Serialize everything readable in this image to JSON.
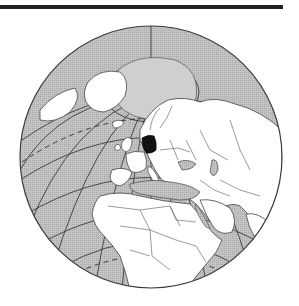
{
  "map": {
    "title": "Germany location on globe",
    "projection": "orthographic",
    "highlighted_country": "Germany",
    "center_region": "Europe",
    "visible_regions": [
      "Arctic Ocean",
      "Greenland",
      "Europe",
      "North Africa",
      "Middle East",
      "Sub-Saharan Africa",
      "Atlantic Ocean",
      "Indian Ocean"
    ],
    "colors": {
      "ocean": "#b9b9b9",
      "land": "#ffffff",
      "border": "#444444",
      "highlight": "#111111",
      "graticule": "#3a3a3a",
      "top_bar": "#222222"
    }
  }
}
